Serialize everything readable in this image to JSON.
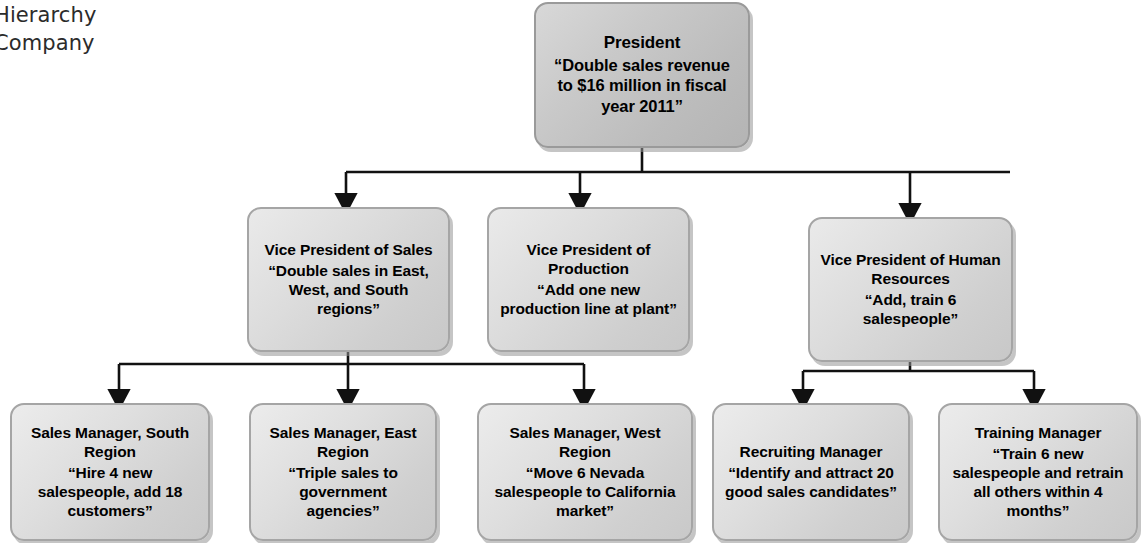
{
  "caption": {
    "text": "Hierarchy\nCompany"
  },
  "diagram": {
    "type": "organizational-hierarchy",
    "accent_color": "#000000",
    "node_fill_color": "#d6d6d6",
    "node_border_color": "#a5a5a5",
    "levels": 3,
    "nodes": [
      {
        "id": "president",
        "level": 1,
        "title": "President",
        "goal": "“Double sales revenue to $16 million in fiscal year 2011”",
        "x": 534,
        "y": 2,
        "w": 216,
        "h": 146
      },
      {
        "id": "vp-sales",
        "level": 2,
        "title": "Vice President of Sales",
        "goal": "“Double sales in East, West, and South regions”",
        "x": 247,
        "y": 207,
        "w": 203,
        "h": 145
      },
      {
        "id": "vp-production",
        "level": 2,
        "title": "Vice President of Production",
        "goal": "“Add one new production line at plant”",
        "x": 487,
        "y": 207,
        "w": 203,
        "h": 145
      },
      {
        "id": "vp-human-resources",
        "level": 2,
        "title": "Vice President of Human Resources",
        "goal": "“Add, train 6 salespeople”",
        "x": 808,
        "y": 217,
        "w": 205,
        "h": 145
      },
      {
        "id": "sales-manager-south",
        "level": 3,
        "title": "Sales Manager, South Region",
        "goal": "“Hire 4 new salespeople, add 18 customers”",
        "x": 10,
        "y": 403,
        "w": 200,
        "h": 138
      },
      {
        "id": "sales-manager-east",
        "level": 3,
        "title": "Sales Manager, East Region",
        "goal": "“Triple sales to government agencies”",
        "x": 249,
        "y": 403,
        "w": 188,
        "h": 138
      },
      {
        "id": "sales-manager-west",
        "level": 3,
        "title": "Sales Manager, West Region",
        "goal": "“Move 6 Nevada salespeople to California market”",
        "x": 477,
        "y": 403,
        "w": 216,
        "h": 138
      },
      {
        "id": "recruiting-manager",
        "level": 3,
        "title": "Recruiting Manager",
        "goal": "“Identify and attract 20 good sales candidates”",
        "x": 712,
        "y": 403,
        "w": 198,
        "h": 138
      },
      {
        "id": "training-manager",
        "level": 3,
        "title": "Training Manager",
        "goal": "“Train 6 new salespeople and retrain all others within 4 months”",
        "x": 938,
        "y": 403,
        "w": 200,
        "h": 138
      }
    ],
    "connectors": [
      {
        "from": "president",
        "to": "vp-sales"
      },
      {
        "from": "president",
        "to": "vp-production"
      },
      {
        "from": "president",
        "to": "vp-human-resources"
      },
      {
        "from": "vp-sales",
        "to": "sales-manager-south"
      },
      {
        "from": "vp-sales",
        "to": "sales-manager-east"
      },
      {
        "from": "vp-sales",
        "to": "sales-manager-west"
      },
      {
        "from": "vp-human-resources",
        "to": "recruiting-manager"
      },
      {
        "from": "vp-human-resources",
        "to": "training-manager"
      }
    ]
  }
}
